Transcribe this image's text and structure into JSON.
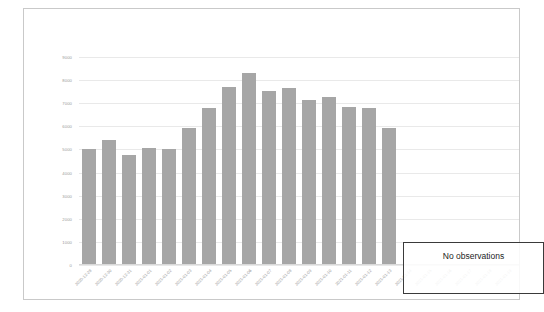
{
  "chart_data": {
    "type": "bar",
    "title": "",
    "xlabel": "",
    "ylabel": "",
    "ylim": [
      0,
      9000
    ],
    "grid": true,
    "legend": false,
    "yticks": [
      "9000",
      "8000",
      "7000",
      "6000",
      "5000",
      "4000",
      "3000",
      "2000",
      "1000",
      "0"
    ],
    "categories": [
      "2020-12-28",
      "2020-12-30",
      "2020-12-31",
      "2021-01-01",
      "2021-01-02",
      "2021-01-03",
      "2021-01-04",
      "2021-01-05",
      "2021-01-06",
      "2021-01-07",
      "2021-01-08",
      "2021-01-09",
      "2021-01-10",
      "2021-01-11",
      "2021-01-12",
      "2021-01-13",
      "2021-01-14",
      "2021-01-15",
      "2021-01-16",
      "2021-01-17",
      "2021-01-18",
      "2021-01-19"
    ],
    "values": [
      5000,
      5400,
      4750,
      5050,
      5000,
      5950,
      6800,
      7700,
      8300,
      7550,
      7650,
      7150,
      7250,
      6850,
      6800,
      5950,
      null,
      null,
      null,
      null,
      null,
      null
    ],
    "annotations": [
      {
        "name": "no-observations",
        "text": "No observations",
        "covers_categories": [
          "2021-01-14",
          "2021-01-15",
          "2021-01-16",
          "2021-01-17",
          "2021-01-18",
          "2021-01-19"
        ]
      }
    ],
    "colors": {
      "bar": "#a6a6a6",
      "grid": "#e9e9e9",
      "tick_text": "#9a9a9a",
      "annotation_border": "#3a3a3a",
      "annotation_text": "#1c1c1c",
      "frame": "#c9c9c9",
      "background": "#ffffff"
    }
  }
}
